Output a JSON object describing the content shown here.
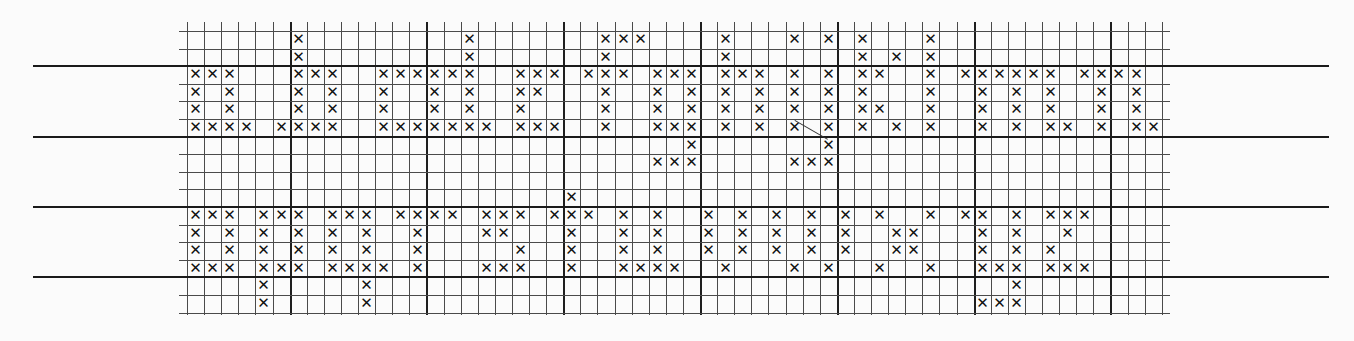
{
  "alphabet_rows": [
    "abcdefghijklmn",
    "opqrstuvwxyz"
  ],
  "mark_glyph": "✕",
  "colors": {
    "paper": "#fbfbfb",
    "grid": "#4a4a4a",
    "ink": "#111111",
    "guide": "#1a1a1a"
  },
  "grid": {
    "origin_x": 187,
    "origin_y": 31,
    "cell_w": 17.1,
    "cell_h": 17.6,
    "cols": 57,
    "rows": 16,
    "thick_col_start": 6,
    "thick_col_every": 8,
    "vline_top": 22,
    "vline_bottom": 315,
    "hline_right": 1170,
    "guide_rows": [
      2,
      6,
      10,
      14
    ],
    "guide_left": 33,
    "guide_right": 1329
  },
  "letters": [
    {
      "char": "a",
      "cells": [
        [
          2,
          0
        ],
        [
          2,
          1
        ],
        [
          2,
          2
        ],
        [
          3,
          0
        ],
        [
          3,
          2
        ],
        [
          4,
          0
        ],
        [
          4,
          2
        ],
        [
          5,
          0
        ],
        [
          5,
          1
        ],
        [
          5,
          2
        ],
        [
          5,
          3
        ]
      ]
    },
    {
      "char": "b",
      "cells": [
        [
          0,
          6
        ],
        [
          1,
          6
        ],
        [
          2,
          6
        ],
        [
          2,
          7
        ],
        [
          2,
          8
        ],
        [
          3,
          6
        ],
        [
          3,
          8
        ],
        [
          4,
          6
        ],
        [
          4,
          8
        ],
        [
          5,
          5
        ],
        [
          5,
          6
        ],
        [
          5,
          7
        ],
        [
          5,
          8
        ]
      ]
    },
    {
      "char": "c",
      "cells": [
        [
          2,
          11
        ],
        [
          2,
          12
        ],
        [
          2,
          13
        ],
        [
          3,
          11
        ],
        [
          4,
          11
        ],
        [
          5,
          11
        ],
        [
          5,
          12
        ],
        [
          5,
          13
        ]
      ]
    },
    {
      "char": "d",
      "cells": [
        [
          0,
          16
        ],
        [
          1,
          16
        ],
        [
          2,
          14
        ],
        [
          2,
          15
        ],
        [
          2,
          16
        ],
        [
          3,
          14
        ],
        [
          3,
          16
        ],
        [
          4,
          14
        ],
        [
          4,
          16
        ],
        [
          5,
          14
        ],
        [
          5,
          15
        ],
        [
          5,
          16
        ],
        [
          5,
          17
        ]
      ]
    },
    {
      "char": "e",
      "cells": [
        [
          2,
          19
        ],
        [
          2,
          20
        ],
        [
          2,
          21
        ],
        [
          3,
          19
        ],
        [
          3,
          20
        ],
        [
          4,
          19
        ],
        [
          5,
          19
        ],
        [
          5,
          20
        ],
        [
          5,
          21
        ]
      ]
    },
    {
      "char": "f",
      "cells": [
        [
          0,
          24
        ],
        [
          0,
          25
        ],
        [
          0,
          26
        ],
        [
          1,
          24
        ],
        [
          2,
          23
        ],
        [
          2,
          24
        ],
        [
          2,
          25
        ],
        [
          3,
          24
        ],
        [
          4,
          24
        ],
        [
          5,
          24
        ]
      ]
    },
    {
      "char": "g",
      "cells": [
        [
          2,
          27
        ],
        [
          2,
          28
        ],
        [
          2,
          29
        ],
        [
          3,
          27
        ],
        [
          3,
          29
        ],
        [
          4,
          27
        ],
        [
          4,
          29
        ],
        [
          5,
          27
        ],
        [
          5,
          28
        ],
        [
          5,
          29
        ],
        [
          6,
          29
        ],
        [
          7,
          27
        ],
        [
          7,
          28
        ],
        [
          7,
          29
        ]
      ]
    },
    {
      "char": "h",
      "cells": [
        [
          0,
          31
        ],
        [
          1,
          31
        ],
        [
          2,
          31
        ],
        [
          2,
          32
        ],
        [
          2,
          33
        ],
        [
          3,
          31
        ],
        [
          3,
          33
        ],
        [
          4,
          31
        ],
        [
          4,
          33
        ],
        [
          5,
          31
        ],
        [
          5,
          33
        ]
      ]
    },
    {
      "char": "i",
      "cells": [
        [
          0,
          35
        ],
        [
          2,
          35
        ],
        [
          3,
          35
        ],
        [
          4,
          35
        ],
        [
          5,
          35
        ]
      ]
    },
    {
      "char": "j",
      "cells": [
        [
          0,
          37
        ],
        [
          2,
          37
        ],
        [
          3,
          37
        ],
        [
          4,
          37
        ],
        [
          5,
          37
        ],
        [
          6,
          37
        ],
        [
          7,
          35
        ],
        [
          7,
          36
        ],
        [
          7,
          37
        ]
      ]
    },
    {
      "char": "k",
      "cells": [
        [
          0,
          39
        ],
        [
          1,
          39
        ],
        [
          2,
          39
        ],
        [
          2,
          40
        ],
        [
          3,
          39
        ],
        [
          4,
          39
        ],
        [
          4,
          40
        ],
        [
          5,
          39
        ],
        [
          5,
          41
        ],
        [
          1,
          41
        ]
      ]
    },
    {
      "char": "l",
      "cells": [
        [
          0,
          43
        ],
        [
          1,
          43
        ],
        [
          2,
          43
        ],
        [
          3,
          43
        ],
        [
          4,
          43
        ],
        [
          5,
          43
        ]
      ]
    },
    {
      "char": "m",
      "cells": [
        [
          2,
          45
        ],
        [
          2,
          46
        ],
        [
          2,
          47
        ],
        [
          2,
          48
        ],
        [
          2,
          49
        ],
        [
          2,
          50
        ],
        [
          3,
          46
        ],
        [
          3,
          48
        ],
        [
          3,
          50
        ],
        [
          4,
          46
        ],
        [
          4,
          48
        ],
        [
          4,
          50
        ],
        [
          5,
          46
        ],
        [
          5,
          48
        ],
        [
          5,
          50
        ],
        [
          5,
          51
        ]
      ]
    },
    {
      "char": "n",
      "cells": [
        [
          2,
          52
        ],
        [
          2,
          53
        ],
        [
          2,
          54
        ],
        [
          2,
          55
        ],
        [
          3,
          53
        ],
        [
          3,
          55
        ],
        [
          4,
          53
        ],
        [
          4,
          55
        ],
        [
          5,
          53
        ],
        [
          5,
          55
        ],
        [
          5,
          56
        ]
      ]
    },
    {
      "char": "o",
      "cells": [
        [
          10,
          0
        ],
        [
          10,
          1
        ],
        [
          10,
          2
        ],
        [
          11,
          0
        ],
        [
          11,
          2
        ],
        [
          12,
          0
        ],
        [
          12,
          2
        ],
        [
          13,
          0
        ],
        [
          13,
          1
        ],
        [
          13,
          2
        ]
      ]
    },
    {
      "char": "p",
      "cells": [
        [
          10,
          4
        ],
        [
          10,
          5
        ],
        [
          10,
          6
        ],
        [
          11,
          4
        ],
        [
          11,
          6
        ],
        [
          12,
          4
        ],
        [
          12,
          6
        ],
        [
          13,
          4
        ],
        [
          13,
          5
        ],
        [
          13,
          6
        ],
        [
          14,
          4
        ],
        [
          15,
          4
        ]
      ]
    },
    {
      "char": "q",
      "cells": [
        [
          10,
          8
        ],
        [
          10,
          9
        ],
        [
          10,
          10
        ],
        [
          11,
          8
        ],
        [
          11,
          10
        ],
        [
          12,
          8
        ],
        [
          12,
          10
        ],
        [
          13,
          8
        ],
        [
          13,
          9
        ],
        [
          13,
          10
        ],
        [
          13,
          11
        ],
        [
          14,
          10
        ],
        [
          15,
          10
        ]
      ]
    },
    {
      "char": "r",
      "cells": [
        [
          10,
          12
        ],
        [
          10,
          13
        ],
        [
          10,
          14
        ],
        [
          10,
          15
        ],
        [
          11,
          13
        ],
        [
          12,
          13
        ],
        [
          13,
          13
        ]
      ]
    },
    {
      "char": "s",
      "cells": [
        [
          10,
          17
        ],
        [
          10,
          18
        ],
        [
          10,
          19
        ],
        [
          11,
          17
        ],
        [
          11,
          18
        ],
        [
          12,
          19
        ],
        [
          13,
          17
        ],
        [
          13,
          18
        ],
        [
          13,
          19
        ]
      ]
    },
    {
      "char": "t",
      "cells": [
        [
          9,
          22
        ],
        [
          10,
          21
        ],
        [
          10,
          22
        ],
        [
          10,
          23
        ],
        [
          11,
          22
        ],
        [
          12,
          22
        ],
        [
          13,
          22
        ]
      ]
    },
    {
      "char": "u",
      "cells": [
        [
          10,
          25
        ],
        [
          10,
          27
        ],
        [
          11,
          25
        ],
        [
          11,
          27
        ],
        [
          12,
          25
        ],
        [
          12,
          27
        ],
        [
          13,
          25
        ],
        [
          13,
          26
        ],
        [
          13,
          27
        ],
        [
          13,
          28
        ]
      ]
    },
    {
      "char": "v",
      "cells": [
        [
          10,
          30
        ],
        [
          10,
          32
        ],
        [
          11,
          30
        ],
        [
          11,
          32
        ],
        [
          12,
          30
        ],
        [
          12,
          32
        ],
        [
          13,
          31
        ]
      ]
    },
    {
      "char": "w",
      "cells": [
        [
          10,
          34
        ],
        [
          10,
          36
        ],
        [
          10,
          38
        ],
        [
          11,
          34
        ],
        [
          11,
          36
        ],
        [
          11,
          38
        ],
        [
          12,
          34
        ],
        [
          12,
          36
        ],
        [
          12,
          38
        ],
        [
          13,
          35
        ],
        [
          13,
          37
        ]
      ]
    },
    {
      "char": "x",
      "cells": [
        [
          10,
          40
        ],
        [
          10,
          43
        ],
        [
          11,
          41
        ],
        [
          11,
          42
        ],
        [
          12,
          41
        ],
        [
          12,
          42
        ],
        [
          13,
          40
        ],
        [
          13,
          43
        ]
      ]
    },
    {
      "char": "y",
      "cells": [
        [
          10,
          45
        ],
        [
          10,
          46
        ],
        [
          10,
          48
        ],
        [
          11,
          46
        ],
        [
          11,
          48
        ],
        [
          12,
          46
        ],
        [
          12,
          48
        ],
        [
          13,
          46
        ],
        [
          13,
          47
        ],
        [
          13,
          48
        ],
        [
          14,
          48
        ],
        [
          15,
          46
        ],
        [
          15,
          47
        ],
        [
          15,
          48
        ]
      ]
    },
    {
      "char": "z",
      "cells": [
        [
          10,
          50
        ],
        [
          10,
          51
        ],
        [
          10,
          52
        ],
        [
          11,
          51
        ],
        [
          12,
          50
        ],
        [
          13,
          50
        ],
        [
          13,
          51
        ],
        [
          13,
          52
        ]
      ]
    }
  ],
  "pen_strokes": [
    {
      "x1": 795,
      "y1": 120,
      "x2": 828,
      "y2": 139
    }
  ]
}
